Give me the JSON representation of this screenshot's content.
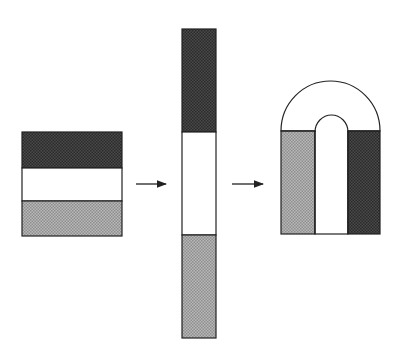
{
  "figure": {
    "description": "Three-step dissection: a square of three horizontal bands is cut and stacked into a tall strip, then bent into an arch (horseshoe) shape.",
    "colors": {
      "dark_band": "#3a3a3a",
      "white_band": "#ffffff",
      "light_band": "#a9a9a9",
      "outline": "#222222",
      "arrow": "#222222",
      "background": "#ffffff"
    },
    "steps": [
      {
        "name": "square",
        "bands_top_to_bottom": [
          "dark",
          "white",
          "light"
        ]
      },
      {
        "name": "tall-strip",
        "bands_top_to_bottom": [
          "dark",
          "white",
          "light"
        ]
      },
      {
        "name": "arch",
        "columns_left_to_right": [
          "light",
          "white",
          "dark"
        ],
        "top": "semicircular arch with inner semicircle"
      }
    ],
    "arrows": [
      {
        "from": "square",
        "to": "tall-strip"
      },
      {
        "from": "tall-strip",
        "to": "arch"
      }
    ]
  }
}
